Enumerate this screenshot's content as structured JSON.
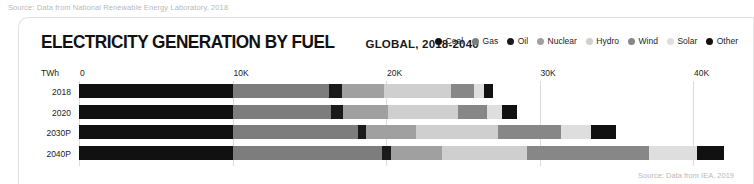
{
  "top_source": "Source: Data from National Renewable Energy Laboratory, 2018",
  "bottom_source": "Source: Data from IEA, 2019",
  "header": {
    "title": "ELECTRICITY GENERATION BY FUEL",
    "subtitle": "GLOBAL, 2018-2040"
  },
  "legend": {
    "items": [
      {
        "label": "Coal",
        "color": "#111111"
      },
      {
        "label": "Gas",
        "color": "#7d7d7d"
      },
      {
        "label": "Oil",
        "color": "#1a1a1a"
      },
      {
        "label": "Nuclear",
        "color": "#a0a0a0"
      },
      {
        "label": "Hydro",
        "color": "#cfcfcf"
      },
      {
        "label": "Wind",
        "color": "#878787"
      },
      {
        "label": "Solar",
        "color": "#dedede"
      },
      {
        "label": "Other",
        "color": "#111111"
      }
    ]
  },
  "axis": {
    "unit_label": "TWh",
    "ticks": [
      "0",
      "10K",
      "20K",
      "30K",
      "40K"
    ],
    "tick_values": [
      0,
      10000,
      20000,
      30000,
      40000
    ],
    "xmin": 0,
    "xmax": 45000
  },
  "chart_data": {
    "type": "bar",
    "orientation": "horizontal",
    "stacked": true,
    "title": "ELECTRICITY GENERATION BY FUEL",
    "subtitle": "GLOBAL, 2018-2040",
    "xlabel": "TWh",
    "ylabel": "",
    "xlim": [
      0,
      45000
    ],
    "xticks": [
      0,
      10000,
      20000,
      30000,
      40000
    ],
    "xticklabels": [
      "0",
      "10K",
      "20K",
      "30K",
      "40K"
    ],
    "grid": true,
    "legend_position": "top-right",
    "categories": [
      "2018",
      "2020",
      "2030P",
      "2040P"
    ],
    "series": [
      {
        "name": "Coal",
        "color": "#111111",
        "values": [
          10030,
          10030,
          10030,
          10030
        ]
      },
      {
        "name": "Gas",
        "color": "#7d7d7d",
        "values": [
          6250,
          6380,
          8140,
          9680
        ]
      },
      {
        "name": "Oil",
        "color": "#1a1a1a",
        "values": [
          850,
          780,
          520,
          590
        ]
      },
      {
        "name": "Nuclear",
        "color": "#a0a0a0",
        "values": [
          2740,
          2930,
          3250,
          3320
        ]
      },
      {
        "name": "Hydro",
        "color": "#cfcfcf",
        "values": [
          4350,
          4550,
          5340,
          5540
        ]
      },
      {
        "name": "Wind",
        "color": "#878787",
        "values": [
          1500,
          1890,
          4100,
          8000
        ]
      },
      {
        "name": "Solar",
        "color": "#dedede",
        "values": [
          660,
          980,
          1960,
          3080
        ]
      },
      {
        "name": "Other",
        "color": "#111111",
        "values": [
          620,
          980,
          1680,
          1760
        ]
      }
    ],
    "totals": [
      27000,
      28520,
      35020,
      42000
    ]
  }
}
